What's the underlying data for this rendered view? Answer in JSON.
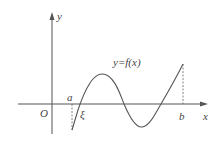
{
  "diagram": {
    "title": "",
    "function_label": "y=f(x)",
    "axes": {
      "x_label": "x",
      "y_label": "y",
      "origin_label": "O"
    },
    "points": {
      "a_label": "a",
      "b_label": "b",
      "xi_label": "ξ"
    },
    "colors": {
      "axis": "#555555",
      "curve": "#555555",
      "text": "#444444",
      "background": "#ffffff"
    }
  }
}
